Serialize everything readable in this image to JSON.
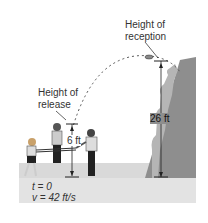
{
  "labels": {
    "reception_line1": "Height of",
    "reception_line2": "reception",
    "release_line1": "Height of",
    "release_line2": "release",
    "release_height": "6 ft",
    "reception_height": "26 ft",
    "time": "t = 0",
    "velocity": "v = 42 ft/s"
  },
  "colors": {
    "ground": "#d6d6d6",
    "cliff_dark": "#8a8a8a",
    "cliff_light": "#b8b8b8",
    "line": "#222222",
    "dashed_path": "#555555"
  }
}
